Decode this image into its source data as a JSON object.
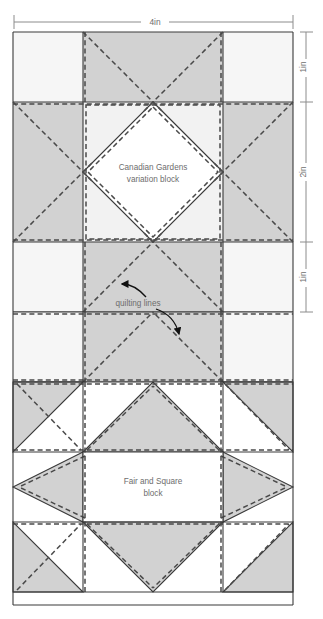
{
  "figure": {
    "type": "quilt-block-diagram",
    "background": "#ffffff",
    "colors": {
      "fabric_light": "#f6f6f6",
      "fabric_gray": "#d2d2d2",
      "fabric_white": "#ffffff",
      "seam_line": "#3a3a3a",
      "quilt_dash": "#4a4a4a",
      "dimension_line": "#8c8c8c",
      "label_text": "#6d6d6d"
    },
    "dimensions": {
      "top": {
        "label": "4in",
        "orientation": "horizontal"
      },
      "right": [
        {
          "label": "1in",
          "orientation": "vertical"
        },
        {
          "label": "2in",
          "orientation": "vertical"
        },
        {
          "label": "1in",
          "orientation": "vertical"
        }
      ]
    },
    "blocks": [
      {
        "name": "canadian-gardens",
        "label_line1": "Canadian Gardens",
        "label_line2": "variation block"
      },
      {
        "name": "fair-and-square",
        "label_line1": "Fair and Square",
        "label_line2": "block"
      }
    ],
    "annotations": [
      {
        "name": "quilting-lines",
        "label": "quilting lines",
        "arrows": 2
      }
    ],
    "caption": ""
  }
}
